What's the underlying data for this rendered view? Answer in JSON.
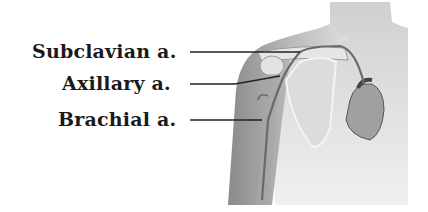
{
  "diagram": {
    "labels": [
      {
        "id": "subclavian",
        "text": "Subclavian a."
      },
      {
        "id": "axillary",
        "text": "Axillary a."
      },
      {
        "id": "brachial",
        "text": "Brachial a."
      }
    ]
  }
}
